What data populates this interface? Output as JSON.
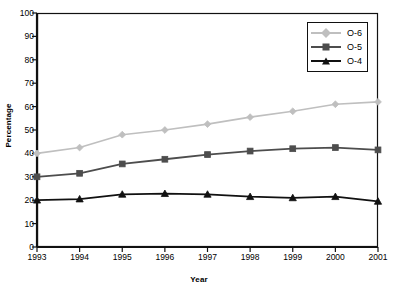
{
  "chart_data": {
    "type": "line",
    "title": "",
    "xlabel": "Year",
    "ylabel": "Percentage",
    "categories": [
      "1993",
      "1994",
      "1995",
      "1996",
      "1997",
      "1998",
      "1999",
      "2000",
      "2001"
    ],
    "x": [
      1993,
      1994,
      1995,
      1996,
      1997,
      1998,
      1999,
      2000,
      2001
    ],
    "xlim": [
      1993,
      2001
    ],
    "ylim": [
      0,
      100
    ],
    "ytick_labels": [
      "0",
      "10",
      "20",
      "30",
      "40",
      "50",
      "60",
      "70",
      "80",
      "90",
      "100"
    ],
    "yticks": [
      0,
      10,
      20,
      30,
      40,
      50,
      60,
      70,
      80,
      90,
      100
    ],
    "grid": false,
    "legend_position": "top-right",
    "series": [
      {
        "name": "O-6",
        "marker": "diamond",
        "color": "#bfbfbf",
        "values": [
          40.0,
          42.5,
          48.0,
          50.0,
          52.5,
          55.5,
          58.0,
          61.0,
          62.0
        ]
      },
      {
        "name": "O-5",
        "marker": "square",
        "color": "#4d4d4d",
        "values": [
          30.0,
          31.5,
          35.5,
          37.5,
          39.5,
          41.0,
          42.0,
          42.5,
          41.5
        ]
      },
      {
        "name": "O-4",
        "marker": "triangle",
        "color": "#111111",
        "values": [
          20.0,
          20.5,
          22.5,
          22.8,
          22.5,
          21.5,
          21.0,
          21.5,
          19.5
        ]
      }
    ]
  },
  "axes": {
    "frame_color": "#111111",
    "tick_color": "#111111"
  },
  "top_fragment": ""
}
